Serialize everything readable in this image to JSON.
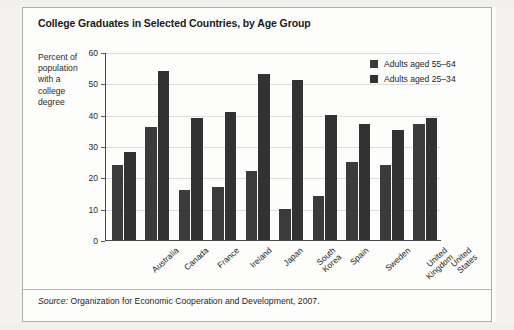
{
  "figure": {
    "title": "College Graduates in Selected Countries, by Age Group",
    "y_axis_caption_lines": [
      "Percent of",
      "population",
      "with a",
      "college",
      "degree"
    ],
    "source_label": "Source:",
    "source_text": "Organization for Economic Cooperation and Development, 2007."
  },
  "legend": {
    "position": "top-right",
    "items": [
      {
        "label": "Adults aged 55–64",
        "color": "#3b3b3b"
      },
      {
        "label": "Adults aged 25–34",
        "color": "#323232"
      }
    ]
  },
  "colors": {
    "series_55_64": "#3b3b3b",
    "series_25_34": "#323232",
    "gridline": "#dcdcd8",
    "axis": "#4a4a4a",
    "frame": "#aeaeab"
  },
  "chart_data": {
    "type": "bar",
    "title": "College Graduates in Selected Countries, by Age Group",
    "xlabel": "",
    "ylabel": "Percent of population with a college degree",
    "ylim": [
      0,
      60
    ],
    "yticks": [
      0,
      10,
      20,
      30,
      40,
      50,
      60
    ],
    "ytick_labels": [
      "0",
      "10",
      "20",
      "30",
      "40",
      "50",
      "60"
    ],
    "grid": true,
    "legend_position": "top-right",
    "categories": [
      "Australia",
      "Canada",
      "France",
      "Ireland",
      "Japan",
      "South Korea",
      "Spain",
      "Sweden",
      "United Kingdom",
      "United States"
    ],
    "category_label_lines": [
      [
        "Australia"
      ],
      [
        "Canada"
      ],
      [
        "France"
      ],
      [
        "Ireland"
      ],
      [
        "Japan"
      ],
      [
        "South",
        "Korea"
      ],
      [
        "Spain"
      ],
      [
        "Sweden"
      ],
      [
        "United",
        "Kingdom"
      ],
      [
        "United",
        "States"
      ]
    ],
    "series": [
      {
        "name": "Adults aged 55–64",
        "values": [
          24,
          36,
          16,
          17,
          22,
          10,
          14,
          25,
          24,
          37
        ]
      },
      {
        "name": "Adults aged 25–34",
        "values": [
          28,
          54,
          39,
          41,
          53,
          51,
          40,
          37,
          35,
          39
        ]
      }
    ],
    "source": "Organization for Economic Cooperation and Development, 2007."
  }
}
